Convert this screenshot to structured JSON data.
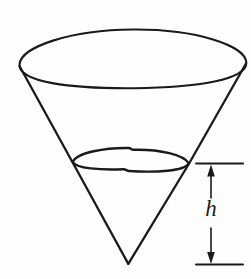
{
  "figure": {
    "kind": "geometry-diagram",
    "background_color": "#fefefe",
    "stroke_color": "#1a1a1a",
    "width": 251,
    "height": 279
  },
  "labels": {
    "height_symbol": "h"
  },
  "geometry": {
    "top_rim": {
      "name": "cone-opening-ellipse",
      "center_x": 132,
      "center_y": 58,
      "radius_x": 114,
      "radius_y": 29
    },
    "apex": {
      "name": "cone-apex",
      "x": 128,
      "y": 264
    },
    "left_edge": {
      "name": "cone-left-side",
      "x1": 19,
      "y1": 66,
      "x2": 128,
      "y2": 264
    },
    "right_edge": {
      "name": "cone-right-side",
      "x1": 246,
      "y1": 64,
      "x2": 128,
      "y2": 264
    },
    "liquid_surface": {
      "name": "liquid-surface-ellipse",
      "center_x": 130,
      "center_y": 160,
      "radius_x": 58,
      "radius_y": 11
    },
    "dimension": {
      "name": "height-dimension-h",
      "arrow_x": 211,
      "top_y": 164,
      "bottom_y": 264,
      "tick_left_x": 196,
      "tick_right_x": 243,
      "label_x": 209,
      "label_y": 212
    }
  }
}
